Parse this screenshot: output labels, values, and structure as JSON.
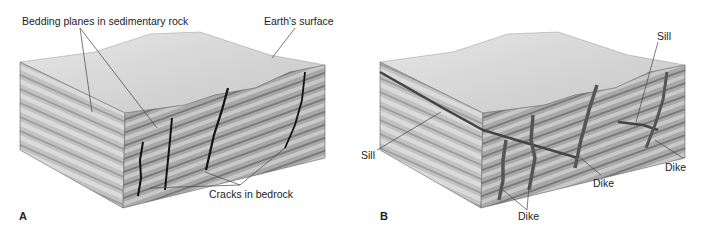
{
  "figure": {
    "panels": [
      {
        "id": "A",
        "panel_label": "A",
        "labels": {
          "bedding_planes": "Bedding planes in sedimentary rock",
          "earths_surface": "Earth's surface",
          "cracks": "Cracks in bedrock"
        }
      },
      {
        "id": "B",
        "panel_label": "B",
        "labels": {
          "sill_left": "Sill",
          "sill_right": "Sill",
          "dike_bottom": "Dike",
          "dike_middle": "Dike",
          "dike_right": "Dike"
        }
      }
    ],
    "colors": {
      "top_face": "#d4d4d4",
      "left_face": "#b8b8b8",
      "front_face": "#a6a6a6",
      "crack": "#111111",
      "dike": "#555555",
      "leader_line": "#444444"
    }
  }
}
